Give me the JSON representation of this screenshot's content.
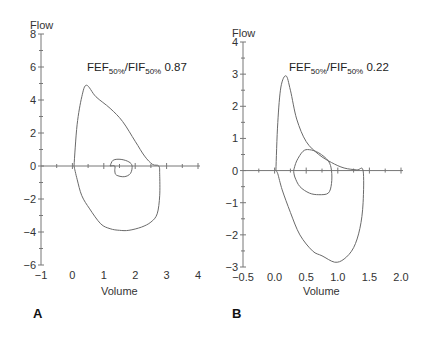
{
  "chart_data": [
    {
      "panel": "A",
      "type": "line",
      "title": "",
      "annotation": {
        "main": "FEF",
        "sub1": "50%",
        "mid": "/FIF",
        "sub2": "50%",
        "value": "0.87"
      },
      "xlabel": "Volume",
      "ylabel": "Flow",
      "xlim": [
        -1,
        4
      ],
      "ylim": [
        -6,
        8
      ],
      "xticks": [
        "-1",
        "0",
        "1",
        "2",
        "3",
        "4"
      ],
      "yticks": [
        "8",
        "6",
        "4",
        "2",
        "0",
        "-2",
        "-4",
        "-6"
      ],
      "grid": false,
      "series": [
        {
          "name": "flow-volume loop (outer)",
          "x": [
            0.05,
            0.15,
            0.3,
            0.45,
            0.75,
            1.2,
            1.6,
            2.0,
            2.3,
            2.55,
            2.75,
            2.78,
            2.78,
            2.7,
            2.5,
            2.2,
            1.8,
            1.5,
            1.2,
            0.9,
            0.55,
            0.3,
            0.15,
            0.05
          ],
          "y": [
            0,
            2.5,
            4.2,
            4.9,
            4.2,
            3.5,
            2.7,
            1.5,
            0.6,
            0.1,
            0,
            -0.5,
            -1.8,
            -2.9,
            -3.4,
            -3.7,
            -3.9,
            -3.9,
            -3.8,
            -3.5,
            -2.6,
            -1.8,
            -0.8,
            0
          ]
        },
        {
          "name": "flow-volume loop (inner)",
          "x": [
            1.2,
            1.3,
            1.55,
            1.8,
            1.9,
            1.85,
            1.65,
            1.4,
            1.35,
            1.35,
            1.2
          ],
          "y": [
            0,
            0.35,
            0.4,
            0.25,
            0,
            -0.45,
            -0.65,
            -0.55,
            -0.3,
            0,
            0
          ]
        }
      ]
    },
    {
      "panel": "B",
      "type": "line",
      "title": "",
      "annotation": {
        "main": "FEF",
        "sub1": "50%",
        "mid": "/FIF",
        "sub2": "50%",
        "value": "0.22"
      },
      "xlabel": "Volume",
      "ylabel": "Flow",
      "xlim": [
        -0.5,
        2.0
      ],
      "ylim": [
        -3,
        4
      ],
      "xticks": [
        "-0.5",
        "0.0",
        "0.5",
        "1.0",
        "1.5",
        "2.0"
      ],
      "yticks": [
        "4",
        "3",
        "2",
        "1",
        "0",
        "-1",
        "-2",
        "-3"
      ],
      "grid": false,
      "series": [
        {
          "name": "flow-volume loop (outer)",
          "x": [
            0.02,
            0.05,
            0.1,
            0.18,
            0.25,
            0.35,
            0.5,
            0.7,
            0.9,
            1.1,
            1.3,
            1.4,
            1.4,
            1.35,
            1.25,
            1.1,
            0.95,
            0.75,
            0.6,
            0.4,
            0.25,
            0.12,
            0.05,
            0.02
          ],
          "y": [
            0,
            1.5,
            2.6,
            2.95,
            2.5,
            1.6,
            0.9,
            0.5,
            0.25,
            0.08,
            0.02,
            0,
            -1.0,
            -1.8,
            -2.4,
            -2.75,
            -2.85,
            -2.65,
            -2.5,
            -2.0,
            -1.3,
            -0.6,
            -0.1,
            0
          ]
        },
        {
          "name": "flow-volume loop (inner)",
          "x": [
            0.3,
            0.35,
            0.45,
            0.55,
            0.7,
            0.85,
            0.9,
            0.9,
            0.85,
            0.7,
            0.55,
            0.4,
            0.32,
            0.3
          ],
          "y": [
            0,
            0.3,
            0.6,
            0.65,
            0.55,
            0.3,
            0,
            -0.4,
            -0.7,
            -0.75,
            -0.7,
            -0.5,
            -0.2,
            0
          ]
        }
      ]
    }
  ],
  "panels": [
    {
      "letter": "A",
      "ylabel": "Flow",
      "xlabel": "Volume",
      "annotation": {
        "main": "FEF",
        "sub1": "50%",
        "mid": "/FIF",
        "sub2": "50%",
        "value": " 0.87"
      }
    },
    {
      "letter": "B",
      "ylabel": "Flow",
      "xlabel": "Volume",
      "annotation": {
        "main": "FEF",
        "sub1": "50%",
        "mid": "/FIF",
        "sub2": "50%",
        "value": " 0.22"
      }
    }
  ]
}
